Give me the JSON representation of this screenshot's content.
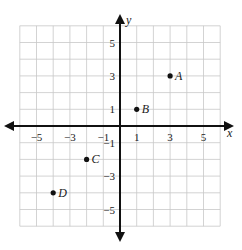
{
  "chart_data": {
    "type": "scatter",
    "title": "",
    "xlabel": "x",
    "ylabel": "y",
    "xlim": [
      -6,
      6
    ],
    "ylim": [
      -6,
      6
    ],
    "grid": true,
    "x_ticks": [
      -5,
      -3,
      -1,
      1,
      3,
      5
    ],
    "y_ticks": [
      5,
      3,
      1,
      -1,
      -3,
      -5
    ],
    "x_tick_labels": [
      "−5",
      "−3",
      "−1",
      "1",
      "3",
      "5"
    ],
    "y_tick_labels": [
      "5",
      "3",
      "1",
      "−1",
      "−3",
      "−5"
    ],
    "points": [
      {
        "label": "A",
        "x": 3,
        "y": 3
      },
      {
        "label": "B",
        "x": 1,
        "y": 1
      },
      {
        "label": "C",
        "x": -2,
        "y": -2
      },
      {
        "label": "D",
        "x": -4,
        "y": -4
      }
    ]
  }
}
